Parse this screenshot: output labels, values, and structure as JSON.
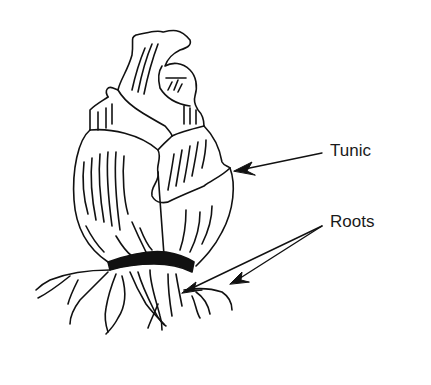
{
  "diagram": {
    "labels": {
      "tunic": "Tunic",
      "roots": "Roots"
    },
    "colors": {
      "line": "#111111",
      "background": "#ffffff",
      "basal_plate": "#111111"
    }
  }
}
